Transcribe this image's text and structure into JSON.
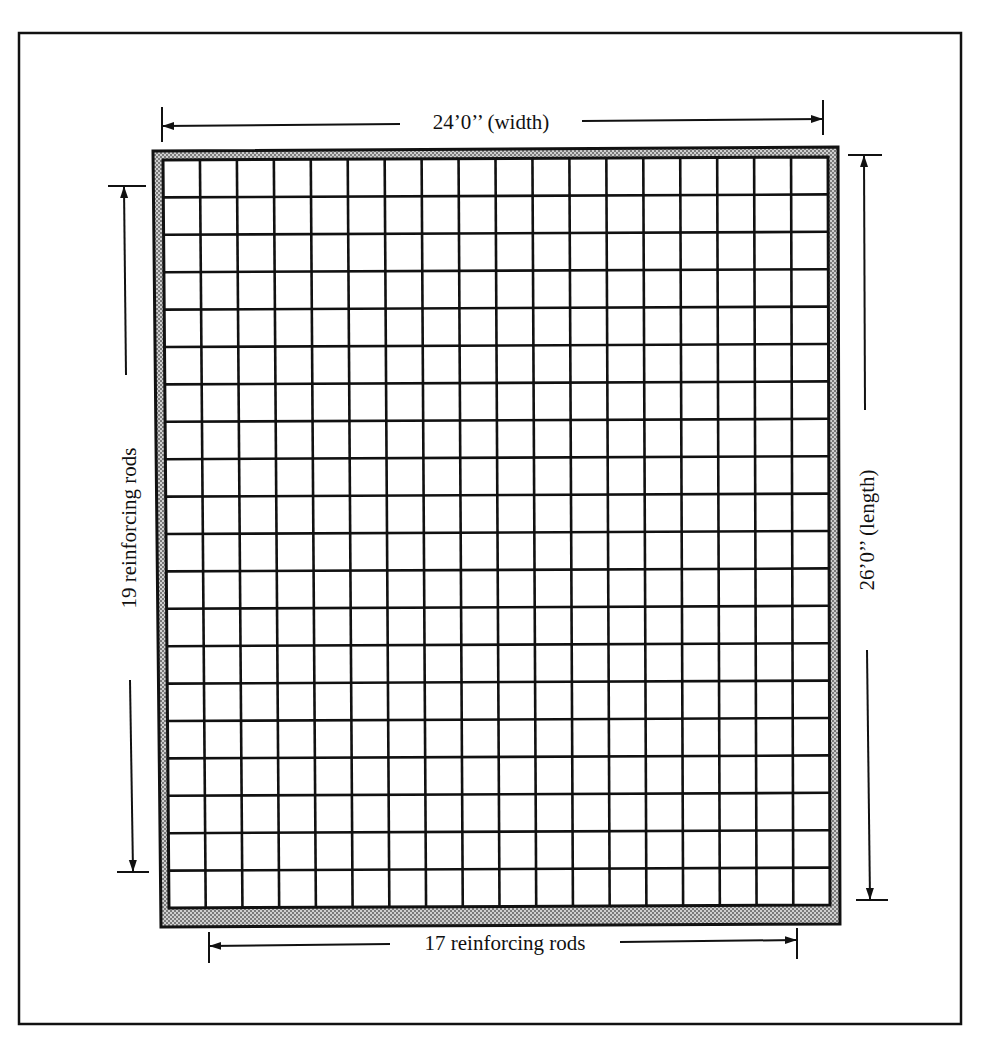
{
  "figure": {
    "width_label": "24’0’’ (width)",
    "length_label": "26’0’’ (length)",
    "horizontal_rods_label": "19 reinforcing rods",
    "vertical_rods_label": "17 reinforcing rods"
  },
  "slab": {
    "width_ft": 24,
    "length_ft": 26,
    "vertical_rods": 17,
    "horizontal_rods": 19,
    "columns": 18,
    "rows": 20,
    "border_pattern": "stippled-gray"
  },
  "colors": {
    "ink": "#111111",
    "border_fill": "#a8a8a8",
    "background": "#ffffff"
  }
}
